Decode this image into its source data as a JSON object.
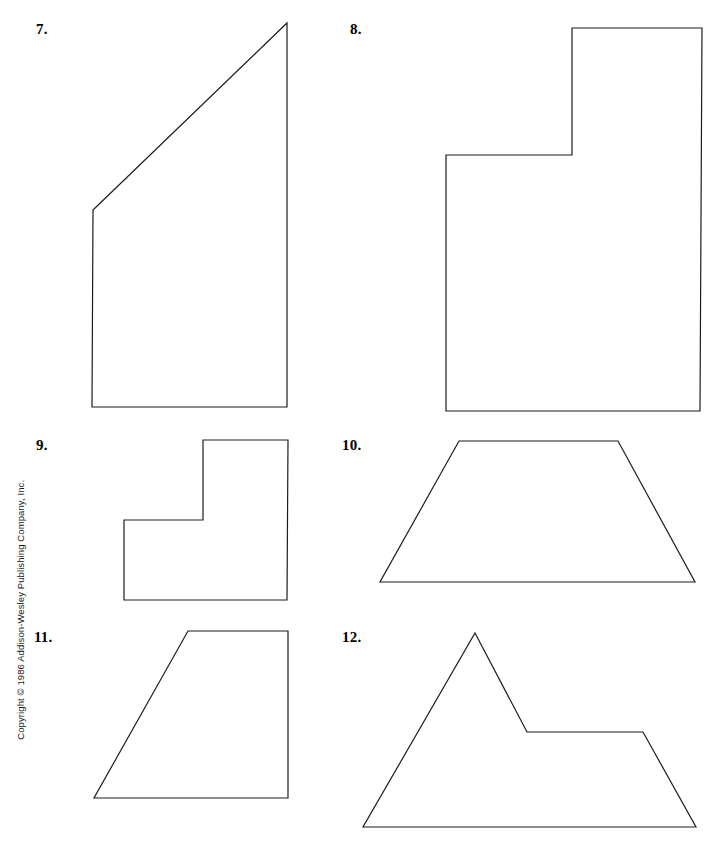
{
  "page": {
    "width": 713,
    "height": 844,
    "background_color": "#ffffff",
    "stroke_color": "#1c1c20",
    "text_color": "#000000"
  },
  "copyright": {
    "text": "Copyright © 1986 Addison-Wesley Publishing Company, Inc.",
    "orientation": "vertical-bottom-to-top"
  },
  "figures": [
    {
      "number": "7.",
      "label_x": 36,
      "label_y": 22,
      "shape_type": "right-trapezoid",
      "points": "93,210 287,23 287,407 92,407"
    },
    {
      "number": "8.",
      "label_x": 350,
      "label_y": 22,
      "shape_type": "L-shaped-hexagon",
      "points": "572,28 702,28 700,411 446,411 446,155 572,155"
    },
    {
      "number": "9.",
      "label_x": 36,
      "label_y": 438,
      "shape_type": "L-shaped-hexagon",
      "points": "203,440 288,440 287,600 124,600 124,520 203,520"
    },
    {
      "number": "10.",
      "label_x": 342,
      "label_y": 438,
      "shape_type": "isosceles-trapezoid",
      "points": "459,441 618,441 695,582 380,582"
    },
    {
      "number": "11.",
      "label_x": 34,
      "label_y": 630,
      "shape_type": "right-trapezoid",
      "points": "188,631 288,631 288,798 94,798"
    },
    {
      "number": "12.",
      "label_x": 342,
      "label_y": 630,
      "shape_type": "mountain-pentagon",
      "points": "475,633 527,732 643,732 696,827 363,827"
    }
  ]
}
